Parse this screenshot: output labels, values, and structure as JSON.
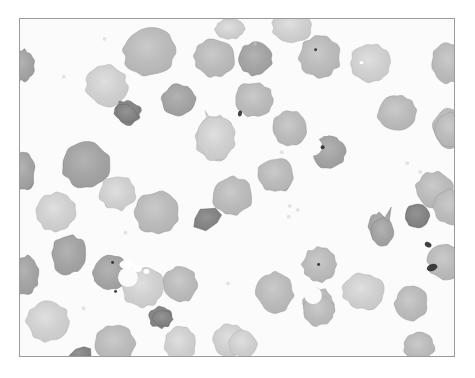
{
  "figure": {
    "kind": "photomicrograph",
    "modality": "brightfield light microscopy",
    "color_mode": "grayscale",
    "frame": {
      "x": 19,
      "y": 18,
      "width": 436,
      "height": 339,
      "border_color": "#9a9a9a",
      "border_width_px": 1
    },
    "page_background": "#ffffff",
    "field_background": "#fbfbfb",
    "palette": {
      "background_white": "#fbfbfb",
      "cell_light": "#c9c9c9",
      "cell_mid": "#b4b4b4",
      "cell_dark": "#9d9d9d",
      "cell_very_dark": "#7e7e7e",
      "cell_membrane_edge": "#8e8e8e",
      "inclusion_black": "#303030",
      "artifact_white": "#ffffff",
      "frame_border": "#9a9a9a"
    }
  },
  "cells": [
    {
      "id": "rbc-01",
      "cx": 149,
      "cy": 51,
      "rx": 26,
      "ry": 24,
      "rot": -12,
      "tone": "cell_mid",
      "edge": 0.4,
      "wobble": 0.07
    },
    {
      "id": "rbc-02",
      "cx": 106,
      "cy": 85,
      "rx": 21,
      "ry": 20,
      "rot": 18,
      "tone": "cell_light",
      "edge": 0.36,
      "wobble": 0.09
    },
    {
      "id": "rbc-03",
      "cx": 127,
      "cy": 112,
      "rx": 13,
      "ry": 12,
      "rot": 24,
      "tone": "cell_very_dark",
      "edge": 0.3,
      "wobble": 0.13
    },
    {
      "id": "rbc-04",
      "cx": 178,
      "cy": 100,
      "rx": 17,
      "ry": 16,
      "rot": -8,
      "tone": "cell_dark",
      "edge": 0.34,
      "wobble": 0.1
    },
    {
      "id": "rbc-05",
      "cx": 214,
      "cy": 57,
      "rx": 20,
      "ry": 19,
      "rot": 5,
      "tone": "cell_mid",
      "edge": 0.36,
      "wobble": 0.08
    },
    {
      "id": "rbc-06",
      "cx": 255,
      "cy": 58,
      "rx": 17,
      "ry": 16,
      "rot": -15,
      "tone": "cell_dark",
      "edge": 0.34,
      "wobble": 0.09
    },
    {
      "id": "rbc-07",
      "cx": 254,
      "cy": 99,
      "rx": 20,
      "ry": 17,
      "rot": 12,
      "tone": "cell_mid",
      "edge": 0.34,
      "wobble": 0.09
    },
    {
      "id": "rbc-08",
      "cx": 320,
      "cy": 56,
      "rx": 21,
      "ry": 20,
      "rot": -5,
      "tone": "cell_mid",
      "edge": 0.36,
      "wobble": 0.08
    },
    {
      "id": "rbc-09",
      "cx": 292,
      "cy": 25,
      "rx": 20,
      "ry": 16,
      "rot": 8,
      "tone": "cell_light",
      "edge": 0.34,
      "wobble": 0.08
    },
    {
      "id": "rbc-10",
      "cx": 371,
      "cy": 62,
      "rx": 20,
      "ry": 19,
      "rot": 14,
      "tone": "cell_light",
      "edge": 0.34,
      "wobble": 0.07
    },
    {
      "id": "rbc-11",
      "cx": 450,
      "cy": 62,
      "rx": 18,
      "ry": 20,
      "rot": 0,
      "tone": "cell_mid",
      "edge": 0.34,
      "wobble": 0.08
    },
    {
      "id": "rbc-12",
      "cx": 22,
      "cy": 65,
      "rx": 11,
      "ry": 16,
      "rot": 0,
      "tone": "cell_dark",
      "edge": 0.32,
      "wobble": 0.1
    },
    {
      "id": "rbc-13",
      "cx": 215,
      "cy": 138,
      "rx": 19,
      "ry": 22,
      "rot": 6,
      "tone": "cell_light",
      "edge": 0.34,
      "wobble": 0.09
    },
    {
      "id": "rbc-14",
      "cx": 290,
      "cy": 128,
      "rx": 17,
      "ry": 18,
      "rot": 0,
      "tone": "cell_mid",
      "edge": 0.34,
      "wobble": 0.07
    },
    {
      "id": "rbc-15",
      "cx": 398,
      "cy": 113,
      "rx": 19,
      "ry": 18,
      "rot": -10,
      "tone": "cell_mid",
      "edge": 0.34,
      "wobble": 0.08
    },
    {
      "id": "rbc-16",
      "cx": 451,
      "cy": 128,
      "rx": 17,
      "ry": 19,
      "rot": 0,
      "tone": "cell_mid",
      "edge": 0.34,
      "wobble": 0.08
    },
    {
      "id": "rbc-17",
      "cx": 86,
      "cy": 165,
      "rx": 24,
      "ry": 23,
      "rot": -6,
      "tone": "cell_dark",
      "edge": 0.34,
      "wobble": 0.08
    },
    {
      "id": "rbc-18",
      "cx": 22,
      "cy": 172,
      "rx": 12,
      "ry": 19,
      "rot": 0,
      "tone": "cell_dark",
      "edge": 0.32,
      "wobble": 0.1
    },
    {
      "id": "rbc-19",
      "cx": 276,
      "cy": 175,
      "rx": 18,
      "ry": 17,
      "rot": 10,
      "tone": "cell_mid",
      "edge": 0.34,
      "wobble": 0.08
    },
    {
      "id": "rbc-20",
      "cx": 232,
      "cy": 196,
      "rx": 20,
      "ry": 19,
      "rot": -5,
      "tone": "cell_mid",
      "edge": 0.34,
      "wobble": 0.09
    },
    {
      "id": "rbc-21",
      "cx": 117,
      "cy": 193,
      "rx": 18,
      "ry": 17,
      "rot": 12,
      "tone": "cell_light",
      "edge": 0.34,
      "wobble": 0.09
    },
    {
      "id": "rbc-22",
      "cx": 55,
      "cy": 212,
      "rx": 20,
      "ry": 19,
      "rot": -8,
      "tone": "cell_light",
      "edge": 0.34,
      "wobble": 0.08
    },
    {
      "id": "rbc-23",
      "cx": 156,
      "cy": 213,
      "rx": 22,
      "ry": 21,
      "rot": 4,
      "tone": "cell_mid",
      "edge": 0.34,
      "wobble": 0.09
    },
    {
      "id": "rbc-24",
      "cx": 436,
      "cy": 190,
      "rx": 19,
      "ry": 18,
      "rot": 0,
      "tone": "cell_mid",
      "edge": 0.34,
      "wobble": 0.08
    },
    {
      "id": "rbc-25",
      "cx": 452,
      "cy": 129,
      "rx": 16,
      "ry": 17,
      "rot": 0,
      "tone": "cell_mid",
      "edge": 0.34,
      "wobble": 0.07
    },
    {
      "id": "rbc-26",
      "cx": 68,
      "cy": 255,
      "rx": 17,
      "ry": 20,
      "rot": 6,
      "tone": "cell_dark",
      "edge": 0.34,
      "wobble": 0.09
    },
    {
      "id": "rbc-27",
      "cx": 25,
      "cy": 275,
      "rx": 13,
      "ry": 19,
      "rot": 0,
      "tone": "cell_dark",
      "edge": 0.32,
      "wobble": 0.1
    },
    {
      "id": "rbc-28",
      "cx": 143,
      "cy": 288,
      "rx": 21,
      "ry": 20,
      "rot": -6,
      "tone": "cell_light",
      "edge": 0.34,
      "wobble": 0.09
    },
    {
      "id": "rbc-29",
      "cx": 180,
      "cy": 285,
      "rx": 17,
      "ry": 18,
      "rot": 10,
      "tone": "cell_mid",
      "edge": 0.34,
      "wobble": 0.08
    },
    {
      "id": "rbc-30",
      "cx": 160,
      "cy": 318,
      "rx": 11,
      "ry": 11,
      "rot": 0,
      "tone": "cell_very_dark",
      "edge": 0.3,
      "wobble": 0.12
    },
    {
      "id": "rbc-31",
      "cx": 47,
      "cy": 322,
      "rx": 21,
      "ry": 20,
      "rot": 0,
      "tone": "cell_light",
      "edge": 0.34,
      "wobble": 0.08
    },
    {
      "id": "rbc-32",
      "cx": 115,
      "cy": 345,
      "rx": 20,
      "ry": 19,
      "rot": 0,
      "tone": "cell_mid",
      "edge": 0.34,
      "wobble": 0.08
    },
    {
      "id": "rbc-33",
      "cx": 180,
      "cy": 345,
      "rx": 16,
      "ry": 17,
      "rot": 0,
      "tone": "cell_light",
      "edge": 0.34,
      "wobble": 0.08
    },
    {
      "id": "rbc-34",
      "cx": 275,
      "cy": 293,
      "rx": 18,
      "ry": 20,
      "rot": -8,
      "tone": "cell_mid",
      "edge": 0.34,
      "wobble": 0.08
    },
    {
      "id": "rbc-35",
      "cx": 319,
      "cy": 305,
      "rx": 15,
      "ry": 16,
      "rot": 0,
      "tone": "cell_mid",
      "edge": 0.34,
      "wobble": 0.09
    },
    {
      "id": "rbc-36",
      "cx": 320,
      "cy": 265,
      "rx": 17,
      "ry": 17,
      "rot": 0,
      "tone": "cell_mid",
      "edge": 0.34,
      "wobble": 0.08
    },
    {
      "id": "rbc-37",
      "cx": 364,
      "cy": 292,
      "rx": 21,
      "ry": 18,
      "rot": 12,
      "tone": "cell_light",
      "edge": 0.34,
      "wobble": 0.08
    },
    {
      "id": "rbc-38",
      "cx": 412,
      "cy": 304,
      "rx": 16,
      "ry": 18,
      "rot": 0,
      "tone": "cell_mid",
      "edge": 0.34,
      "wobble": 0.08
    },
    {
      "id": "rbc-39",
      "cx": 420,
      "cy": 348,
      "rx": 15,
      "ry": 14,
      "rot": 0,
      "tone": "cell_mid",
      "edge": 0.34,
      "wobble": 0.08
    },
    {
      "id": "rbc-40",
      "cx": 446,
      "cy": 262,
      "rx": 17,
      "ry": 18,
      "rot": 0,
      "tone": "cell_mid",
      "edge": 0.34,
      "wobble": 0.08
    },
    {
      "id": "rbc-41",
      "cx": 452,
      "cy": 207,
      "rx": 17,
      "ry": 18,
      "rot": 0,
      "tone": "cell_mid",
      "edge": 0.34,
      "wobble": 0.08
    },
    {
      "id": "rbc-42",
      "cx": 230,
      "cy": 341,
      "rx": 17,
      "ry": 16,
      "rot": 0,
      "tone": "cell_light",
      "edge": 0.34,
      "wobble": 0.08
    },
    {
      "id": "rbc-43",
      "cx": 230,
      "cy": 28,
      "rx": 15,
      "ry": 10,
      "rot": 0,
      "tone": "cell_light",
      "edge": 0.32,
      "wobble": 0.08
    },
    {
      "id": "rbc-44",
      "cx": 380,
      "cy": 228,
      "rx": 10,
      "ry": 15,
      "rot": -18,
      "tone": "cell_dark",
      "edge": 0.32,
      "wobble": 0.12
    },
    {
      "id": "rbc-45",
      "cx": 243,
      "cy": 345,
      "rx": 14,
      "ry": 13,
      "rot": 0,
      "tone": "cell_light",
      "edge": 0.33,
      "wobble": 0.08
    }
  ],
  "teardrop_cells": [
    {
      "id": "teardrop-01",
      "cx": 216,
      "cy": 138,
      "rx": 19,
      "ry": 22,
      "tail_x": 205,
      "tail_y": 110,
      "tone": "cell_light"
    },
    {
      "id": "teardrop-02",
      "cx": 383,
      "cy": 232,
      "rx": 11,
      "ry": 14,
      "tail_x": 392,
      "tail_y": 207,
      "tone": "cell_dark"
    }
  ],
  "bite_cells": [
    {
      "id": "bite-cell-01",
      "cx": 329,
      "cy": 152,
      "r": 17,
      "bite_angle": 200,
      "tone": "cell_dark"
    },
    {
      "id": "bite-cell-02",
      "cx": 110,
      "cy": 273,
      "r": 18,
      "bite_angle": 15,
      "tone": "cell_dark"
    },
    {
      "id": "bite-cell-03",
      "cx": 319,
      "cy": 311,
      "r": 16,
      "bite_angle": 250,
      "tone": "cell_mid"
    }
  ],
  "fragments": [
    {
      "id": "schistocyte-01",
      "cx": 207,
      "cy": 219,
      "w": 32,
      "h": 19,
      "rot": -15,
      "tone": "cell_very_dark"
    },
    {
      "id": "schistocyte-02",
      "cx": 126,
      "cy": 113,
      "w": 26,
      "h": 23,
      "rot": 20,
      "tone": "cell_very_dark"
    },
    {
      "id": "schistocyte-03",
      "cx": 80,
      "cy": 355,
      "w": 22,
      "h": 14,
      "rot": -28,
      "tone": "cell_very_dark"
    },
    {
      "id": "schistocyte-04",
      "cx": 161,
      "cy": 318,
      "w": 21,
      "h": 19,
      "rot": 10,
      "tone": "cell_very_dark"
    }
  ],
  "dark_cells": [
    {
      "id": "spherocyte-01",
      "cx": 418,
      "cy": 216,
      "r": 12,
      "tone": "cell_very_dark",
      "label": "dense dark spherocyte"
    }
  ],
  "inclusions": [
    {
      "id": "inclusion-01",
      "cx": 429,
      "cy": 245,
      "w": 7,
      "h": 5,
      "rot": 25,
      "color": "inclusion_black"
    },
    {
      "id": "inclusion-02",
      "cx": 433,
      "cy": 268,
      "w": 11,
      "h": 7,
      "rot": -20,
      "color": "inclusion_black"
    },
    {
      "id": "inclusion-03",
      "cx": 323,
      "cy": 147,
      "w": 4,
      "h": 4,
      "rot": 0,
      "color": "inclusion_black"
    },
    {
      "id": "inclusion-04",
      "cx": 240,
      "cy": 113,
      "w": 4,
      "h": 6,
      "rot": 10,
      "color": "inclusion_black"
    },
    {
      "id": "inclusion-05",
      "cx": 316,
      "cy": 49,
      "w": 3,
      "h": 3,
      "rot": 0,
      "color": "inclusion_black"
    },
    {
      "id": "inclusion-06",
      "cx": 115,
      "cy": 292,
      "w": 3,
      "h": 3,
      "rot": 0,
      "color": "inclusion_black"
    },
    {
      "id": "inclusion-07",
      "cx": 319,
      "cy": 265,
      "w": 3,
      "h": 3,
      "rot": 0,
      "color": "inclusion_black"
    },
    {
      "id": "inclusion-08",
      "cx": 112,
      "cy": 263,
      "w": 3,
      "h": 3,
      "rot": 0,
      "color": "inclusion_black"
    }
  ],
  "artifacts": [
    {
      "id": "white-artifact-01",
      "cx": 126,
      "cy": 265,
      "w": 14,
      "h": 9,
      "color": "artifact_white"
    },
    {
      "id": "white-artifact-02",
      "cx": 137,
      "cy": 269,
      "w": 9,
      "h": 7,
      "color": "artifact_white"
    },
    {
      "id": "white-artifact-03",
      "cx": 146,
      "cy": 272,
      "w": 6,
      "h": 5,
      "color": "artifact_white"
    },
    {
      "id": "white-highlight-01",
      "cx": 362,
      "cy": 62,
      "w": 4,
      "h": 3,
      "color": "artifact_white"
    }
  ],
  "faint_specks": [
    {
      "cx": 104,
      "cy": 38,
      "r": 2
    },
    {
      "cx": 63,
      "cy": 76,
      "r": 2
    },
    {
      "cx": 282,
      "cy": 152,
      "r": 2
    },
    {
      "cx": 298,
      "cy": 210,
      "r": 2
    },
    {
      "cx": 125,
      "cy": 233,
      "r": 2
    },
    {
      "cx": 289,
      "cy": 217,
      "r": 2
    },
    {
      "cx": 421,
      "cy": 172,
      "r": 2
    },
    {
      "cx": 290,
      "cy": 206,
      "r": 2
    },
    {
      "cx": 83,
      "cy": 309,
      "r": 2
    },
    {
      "cx": 408,
      "cy": 163,
      "r": 2
    },
    {
      "cx": 255,
      "cy": 43,
      "r": 2
    },
    {
      "cx": 228,
      "cy": 284,
      "r": 2
    }
  ]
}
